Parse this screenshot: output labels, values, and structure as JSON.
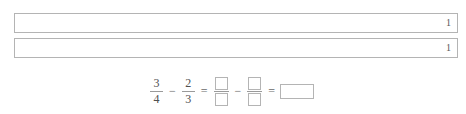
{
  "worksheet": {
    "background_color": "#ffffff",
    "line_color": "#b4b4b4",
    "text_color": "#4f4f4f"
  },
  "fraction_bars": {
    "bars": [
      {
        "name": "bar-top",
        "label": "1",
        "segments": 1
      },
      {
        "name": "bar-bottom",
        "label": "1",
        "segments": 1
      }
    ]
  },
  "equation": {
    "first_fraction": {
      "numerator": "3",
      "denominator": "4"
    },
    "operator_1": "−",
    "second_fraction": {
      "numerator": "2",
      "denominator": "3"
    },
    "equals_1": "=",
    "third_fraction": {
      "numerator": "",
      "denominator": ""
    },
    "operator_2": "−",
    "fourth_fraction": {
      "numerator": "",
      "denominator": ""
    },
    "equals_2": "=",
    "answer": ""
  }
}
